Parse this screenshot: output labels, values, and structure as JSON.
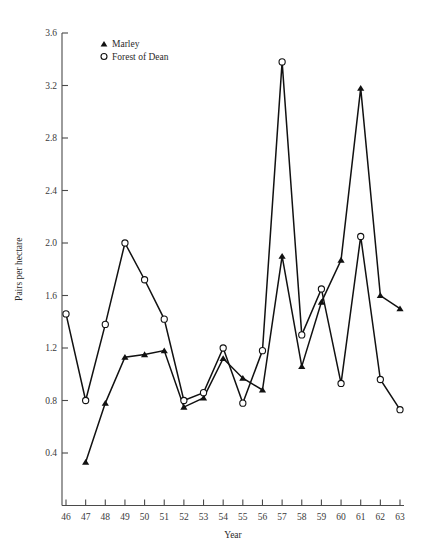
{
  "chart_data": {
    "type": "line",
    "title": "",
    "xlabel": "Year",
    "ylabel": "Pairs per hectare",
    "x": [
      46,
      47,
      48,
      49,
      50,
      51,
      52,
      53,
      54,
      55,
      56,
      57,
      58,
      59,
      60,
      61,
      62,
      63
    ],
    "xtick_labels": [
      "46",
      "47",
      "48",
      "49",
      "50",
      "51",
      "52",
      "53",
      "54",
      "55",
      "56",
      "57",
      "58",
      "59",
      "60",
      "61",
      "62",
      "63"
    ],
    "ytick_labels": [
      "0.4",
      "0.8",
      "1.2",
      "1.6",
      "2.0",
      "2.4",
      "2.8",
      "3.2",
      "3.6"
    ],
    "ytick_values": [
      0.4,
      0.8,
      1.2,
      1.6,
      2.0,
      2.4,
      2.8,
      3.2,
      3.6
    ],
    "xlim": [
      46,
      63
    ],
    "ylim": [
      0.0,
      3.6
    ],
    "grid": false,
    "legend_position": "top-left",
    "series": [
      {
        "name": "Marley",
        "marker": "filled-triangle",
        "x": [
          47,
          48,
          49,
          50,
          51,
          52,
          53,
          54,
          55,
          56,
          57,
          58,
          59,
          60,
          61,
          62,
          63
        ],
        "values": [
          0.33,
          0.78,
          1.13,
          1.15,
          1.18,
          0.75,
          0.82,
          1.12,
          0.97,
          0.88,
          1.9,
          1.06,
          1.55,
          1.87,
          3.18,
          1.6,
          1.5
        ]
      },
      {
        "name": "Forest of Dean",
        "marker": "open-circle",
        "x": [
          46,
          47,
          48,
          49,
          50,
          51,
          52,
          53,
          54,
          55,
          56,
          57,
          58,
          59,
          60,
          61,
          62,
          63
        ],
        "values": [
          1.46,
          0.8,
          1.38,
          2.0,
          1.72,
          1.42,
          0.8,
          0.86,
          1.2,
          0.78,
          1.18,
          3.38,
          1.3,
          1.65,
          0.93,
          2.05,
          0.96,
          0.73
        ]
      }
    ]
  },
  "legend": {
    "items": [
      {
        "label": "Marley",
        "marker": "filled-triangle"
      },
      {
        "label": "Forest of Dean",
        "marker": "open-circle"
      }
    ]
  }
}
